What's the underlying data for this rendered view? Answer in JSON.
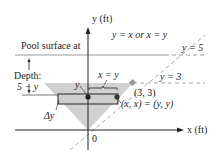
{
  "diagram": {
    "axes": {
      "y_label": "y (ft)",
      "x_label": "x (ft)",
      "origin_label": "0"
    },
    "annotations": {
      "pool_surface": "Pool surface at",
      "line_diag": "y = x or x = y",
      "line_y5": "y = 5",
      "line_y3": "y = 3",
      "depth_label": "Depth:",
      "depth_expr": "5 − y",
      "strip_width": "x = y",
      "y_marker": "y",
      "point_33": "(3, 3)",
      "point_xy": "(x, x) = (y, y)",
      "delta_y": "Δy"
    },
    "colors": {
      "fill": "#d0d0d0",
      "line": "#222222",
      "dashed": "#999999",
      "point_33": "#999999",
      "dot": "#222222"
    }
  }
}
